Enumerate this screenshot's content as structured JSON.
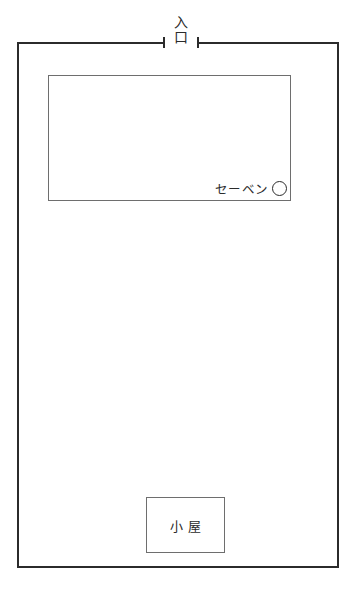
{
  "diagram": {
    "background_color": "#ffffff",
    "line_color": "#2b2b2b",
    "inner_line_color": "#6e6e6e"
  },
  "entrance": {
    "label_top": "入",
    "label_bottom": "口",
    "full_label": "入口"
  },
  "building": {
    "store_label": "セーベン",
    "marker_icon": "circle-icon"
  },
  "hut": {
    "label": "小 屋"
  }
}
